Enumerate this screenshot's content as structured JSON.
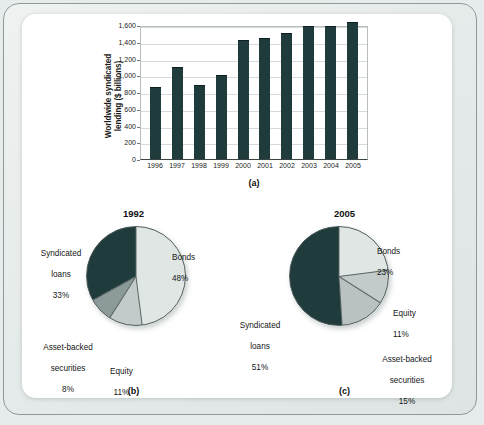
{
  "figure": {
    "panels": [
      {
        "caption": "(a)"
      },
      {
        "caption": "(b)"
      },
      {
        "caption": "(c)"
      }
    ]
  },
  "colors": {
    "dark_teal": "#1f3b3c",
    "light_grey": "#dfe6e4",
    "mid_grey": "#8c9a99",
    "page_background": "#e6eceb",
    "panel_background": "#ffffff"
  },
  "chart_data": [
    {
      "type": "bar",
      "panel": "a",
      "title": "",
      "xlabel": "",
      "ylabel": "Worldwide syndicated lending ($ billions)",
      "ylabel_line1": "Worldwide syndicated",
      "ylabel_line2": "lending ($ billions)",
      "categories": [
        "1996",
        "1997",
        "1998",
        "1999",
        "2000",
        "2001",
        "2002",
        "2003",
        "2004",
        "2005"
      ],
      "values": [
        860,
        1100,
        880,
        1000,
        1420,
        1450,
        1500,
        1590,
        1590,
        1640
      ],
      "ylim": [
        0,
        1600
      ],
      "yticks": [
        0,
        200,
        400,
        600,
        800,
        1000,
        1200,
        1400,
        1600
      ],
      "ytick_labels": [
        "0",
        "200",
        "400",
        "600",
        "800",
        "1,000",
        "1,200",
        "1,400",
        "1,600"
      ],
      "grid": true,
      "legend": "none"
    },
    {
      "type": "pie",
      "panel": "b",
      "title": "1992",
      "labels": [
        "Bonds",
        "Equity",
        "Asset-backed securities",
        "Syndicated loans"
      ],
      "values": [
        48,
        11,
        8,
        33
      ],
      "value_labels": [
        "48%",
        "11%",
        "8%",
        "33%"
      ],
      "slice_colors": [
        "#dfe6e4",
        "#c2cbc9",
        "#8c9a99",
        "#1f3b3c"
      ],
      "annotations": [
        {
          "name": "bonds",
          "text_line1": "Bonds",
          "text_line2": "48%"
        },
        {
          "name": "equity",
          "text_line1": "Equity",
          "text_line2": "11%"
        },
        {
          "name": "asset-backed-securities",
          "text_line1": "Asset-backed",
          "text_line2": "securities",
          "text_line3": "8%"
        },
        {
          "name": "syndicated-loans",
          "text_line1": "Syndicated",
          "text_line2": "loans",
          "text_line3": "33%"
        }
      ]
    },
    {
      "type": "pie",
      "panel": "c",
      "title": "2005",
      "labels": [
        "Bonds",
        "Equity",
        "Asset-backed securities",
        "Syndicated loans"
      ],
      "values": [
        23,
        11,
        15,
        51
      ],
      "value_labels": [
        "23%",
        "11%",
        "15%",
        "51%"
      ],
      "slice_colors": [
        "#dfe6e4",
        "#c2cbc9",
        "#b9c2c0",
        "#1f3b3c"
      ],
      "annotations": [
        {
          "name": "bonds",
          "text_line1": "Bonds",
          "text_line2": "23%"
        },
        {
          "name": "equity",
          "text_line1": "Equity",
          "text_line2": "11%"
        },
        {
          "name": "asset-backed-securities",
          "text_line1": "Asset-backed",
          "text_line2": "securities",
          "text_line3": "15%"
        },
        {
          "name": "syndicated-loans",
          "text_line1": "Syndicated",
          "text_line2": "loans",
          "text_line3": "51%"
        }
      ]
    }
  ]
}
